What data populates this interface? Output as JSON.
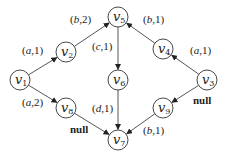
{
  "diagram": {
    "type": "directed-graph",
    "nodes": [
      {
        "id": "v1",
        "base": "v",
        "sub": "1",
        "x": 20,
        "y": 80
      },
      {
        "id": "v2",
        "base": "v",
        "sub": "2",
        "x": 66,
        "y": 52
      },
      {
        "id": "v3",
        "base": "v",
        "sub": "3",
        "x": 207,
        "y": 80
      },
      {
        "id": "v4",
        "base": "v",
        "sub": "4",
        "x": 163,
        "y": 49
      },
      {
        "id": "v5",
        "base": "v",
        "sub": "5",
        "x": 118,
        "y": 17
      },
      {
        "id": "v6",
        "base": "v",
        "sub": "6",
        "x": 118,
        "y": 80
      },
      {
        "id": "v7",
        "base": "v",
        "sub": "7",
        "x": 118,
        "y": 140
      },
      {
        "id": "v8",
        "base": "v",
        "sub": "8",
        "x": 66,
        "y": 108
      },
      {
        "id": "v9",
        "base": "v",
        "sub": "9",
        "x": 163,
        "y": 108
      }
    ],
    "edges": [
      {
        "from": "v1",
        "to": "v2",
        "label_sym": "a",
        "label_num": "1",
        "lx": 22,
        "ly": 54
      },
      {
        "from": "v2",
        "to": "v5",
        "label_sym": "b",
        "label_num": "2",
        "lx": 70,
        "ly": 23
      },
      {
        "from": "v5",
        "to": "v6",
        "label_sym": "c",
        "label_num": "1",
        "lx": 92,
        "ly": 50
      },
      {
        "from": "v4",
        "to": "v5",
        "label_sym": "b",
        "label_num": "1",
        "lx": 143,
        "ly": 23
      },
      {
        "from": "v3",
        "to": "v4",
        "label_sym": "a",
        "label_num": "1",
        "lx": 190,
        "ly": 54
      },
      {
        "from": "v1",
        "to": "v8",
        "label_sym": "a",
        "label_num": "2",
        "lx": 22,
        "ly": 106
      },
      {
        "from": "v6",
        "to": "v7",
        "label_sym": "d",
        "label_num": "1",
        "lx": 92,
        "ly": 112
      },
      {
        "from": "v8",
        "to": "v7",
        "label_null": "null",
        "lx": 70,
        "ly": 133
      },
      {
        "from": "v3",
        "to": "v9",
        "label_null": "null",
        "lx": 193,
        "ly": 104
      },
      {
        "from": "v9",
        "to": "v7",
        "label_sym": "b",
        "label_num": "1",
        "lx": 143,
        "ly": 134
      }
    ]
  }
}
